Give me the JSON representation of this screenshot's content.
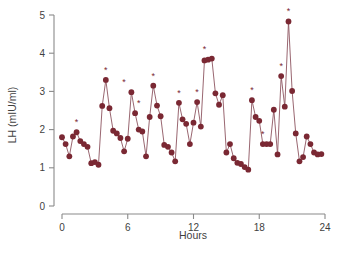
{
  "chart_data": {
    "type": "line",
    "title": "",
    "xlabel": "Hours",
    "ylabel": "LH (mIU/ml)",
    "xlim": [
      0,
      24
    ],
    "ylim": [
      0,
      5
    ],
    "xticks": [
      0,
      6,
      12,
      18,
      24
    ],
    "yticks": [
      0,
      1,
      2,
      3,
      4,
      5
    ],
    "xtick_labels": [
      "0",
      "6",
      "12",
      "18",
      "24"
    ],
    "ytick_labels": [
      "0",
      "1",
      "2",
      "3",
      "4",
      "5"
    ],
    "grid": false,
    "legend": "none",
    "marker_color": "#7a2833",
    "line_color": "#8d5560",
    "axis_color": "#8a8a8a",
    "series": [
      {
        "name": "LH",
        "marker": "circle",
        "x": [
          0.0,
          0.33,
          0.67,
          1.0,
          1.33,
          1.67,
          2.0,
          2.33,
          2.67,
          3.0,
          3.33,
          3.67,
          4.0,
          4.33,
          4.67,
          5.0,
          5.33,
          5.67,
          6.0,
          6.33,
          6.67,
          7.0,
          7.33,
          7.67,
          8.0,
          8.33,
          8.67,
          9.0,
          9.33,
          9.67,
          10.0,
          10.33,
          10.67,
          11.0,
          11.33,
          11.67,
          12.0,
          12.33,
          12.67,
          13.0,
          13.33,
          13.67,
          14.0,
          14.33,
          14.67,
          15.0,
          15.33,
          15.67,
          16.0,
          16.33,
          16.67,
          17.0,
          17.33,
          17.67,
          18.0,
          18.33,
          18.67,
          19.0,
          19.33,
          19.67,
          20.0,
          20.33,
          20.67,
          21.0,
          21.33,
          21.67,
          22.0,
          22.33,
          22.67,
          23.0,
          23.33,
          23.67
        ],
        "y": [
          1.8,
          1.62,
          1.3,
          1.82,
          1.93,
          1.7,
          1.62,
          1.55,
          1.12,
          1.15,
          1.08,
          2.62,
          3.3,
          2.56,
          1.97,
          1.9,
          1.78,
          1.43,
          1.76,
          2.98,
          2.43,
          2.0,
          1.95,
          1.3,
          2.33,
          3.15,
          2.63,
          2.35,
          1.6,
          1.55,
          1.4,
          1.17,
          2.7,
          2.27,
          2.15,
          1.62,
          2.18,
          2.72,
          2.08,
          3.81,
          3.83,
          3.86,
          2.95,
          2.65,
          2.9,
          1.4,
          1.62,
          1.25,
          1.13,
          1.1,
          1.02,
          0.95,
          2.77,
          2.33,
          2.23,
          1.62,
          1.62,
          1.62,
          2.52,
          1.35,
          3.4,
          2.6,
          4.83,
          3.01,
          1.9,
          1.17,
          1.28,
          1.82,
          1.62,
          1.4,
          1.35,
          1.36
        ],
        "peaks": [
          {
            "x": 1.33,
            "y": 1.93
          },
          {
            "x": 4.0,
            "y": 3.3
          },
          {
            "x": 5.67,
            "y": 2.98
          },
          {
            "x": 7.0,
            "y": 2.43
          },
          {
            "x": 8.33,
            "y": 3.15
          },
          {
            "x": 10.67,
            "y": 2.7
          },
          {
            "x": 12.33,
            "y": 2.72
          },
          {
            "x": 13.0,
            "y": 3.86
          },
          {
            "x": 17.33,
            "y": 2.77
          },
          {
            "x": 18.33,
            "y": 1.62
          },
          {
            "x": 20.0,
            "y": 3.4
          },
          {
            "x": 20.67,
            "y": 4.83
          }
        ]
      }
    ],
    "series_extra": [
      {
        "x": 22.33,
        "y": 1.62
      },
      {
        "x": 23.0,
        "y": 1.72
      },
      {
        "x": 23.33,
        "y": 1.8
      },
      {
        "x": 23.67,
        "y": 1.62
      }
    ]
  }
}
